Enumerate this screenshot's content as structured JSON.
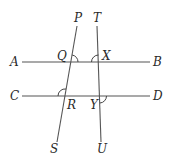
{
  "diagram": {
    "type": "geometry-parallel-lines-transversals",
    "colors": {
      "line": "#555555",
      "label": "#2a2a2a",
      "background": "#ffffff"
    },
    "lines": [
      {
        "name": "AB",
        "start_label": "A",
        "end_label": "B"
      },
      {
        "name": "CD",
        "start_label": "C",
        "end_label": "D"
      },
      {
        "name": "PS",
        "start_label": "P",
        "end_label": "S"
      },
      {
        "name": "TU",
        "start_label": "T",
        "end_label": "U"
      }
    ],
    "labels": {
      "A": "A",
      "B": "B",
      "C": "C",
      "D": "D",
      "P": "P",
      "S": "S",
      "T": "T",
      "U": "U",
      "Q": "Q",
      "X": "X",
      "R": "R",
      "Y": "Y"
    },
    "intersections": [
      {
        "point": "Q",
        "lines": [
          "AB",
          "PS"
        ],
        "marked_angle": "PQB"
      },
      {
        "point": "X",
        "lines": [
          "AB",
          "TU"
        ],
        "marked_angle": "TXA"
      },
      {
        "point": "R",
        "lines": [
          "CD",
          "PS"
        ],
        "marked_angle": "QRC"
      },
      {
        "point": "Y",
        "lines": [
          "CD",
          "TU"
        ],
        "marked_angle": "UYD"
      }
    ]
  }
}
